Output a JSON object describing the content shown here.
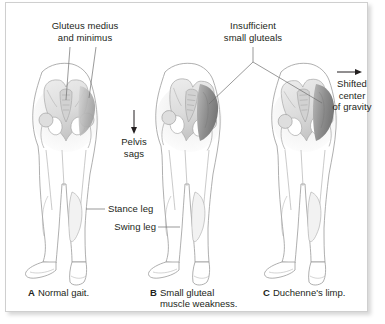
{
  "figure": {
    "background_color": "#ffffff",
    "frame_color": "#cfcfcf",
    "text_color": "#231f20"
  },
  "annotations": {
    "gluteus_label": "Gluteus medius\nand minimus",
    "insufficient_label": "Insufficient\nsmall gluteals",
    "pelvis_sags_label": "Pelvis\nsags",
    "shifted_cog_label": "Shifted\ncenter\nof gravity",
    "stance_leg_label": "Stance leg",
    "swing_leg_label": "Swing leg"
  },
  "captions": [
    {
      "letter": "A",
      "text": "Normal gait."
    },
    {
      "letter": "B",
      "text": "Small gluteal\nmuscle weakness."
    },
    {
      "letter": "C",
      "text": "Duchenne's limp."
    }
  ],
  "panels": [
    {
      "id": "panel-a",
      "letter": "A",
      "name": "normal-gait-figure",
      "description": "Posterior view of pelvis and legs, normal stance",
      "muscle_shading": "light"
    },
    {
      "id": "panel-b",
      "letter": "B",
      "name": "small-gluteal-weakness-figure",
      "description": "Posterior view with sagging pelvis on swing side",
      "muscle_shading": "dark"
    },
    {
      "id": "panel-c",
      "letter": "C",
      "name": "duchenne-limp-figure",
      "description": "Posterior view with trunk lean and shifted center of gravity",
      "muscle_shading": "dark"
    }
  ],
  "icons": {
    "down_arrow": "down-arrow-icon",
    "right_arrow": "right-arrow-icon"
  },
  "colors": {
    "outline": "#8c8c8c",
    "bone_light": "#e2e2e2",
    "bone_mid": "#c9c9c9",
    "muscle_dark": "#8f8f8f",
    "muscle_mid": "#b0b0b0",
    "leader_line": "#6f6f6f"
  }
}
